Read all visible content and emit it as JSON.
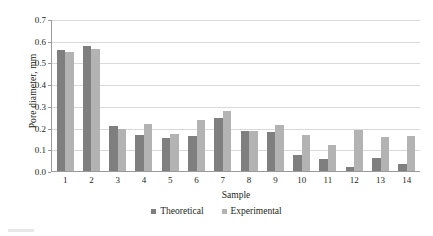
{
  "chart_data": {
    "type": "bar",
    "title": "",
    "xlabel": "Sample",
    "ylabel": "Pore diameter, mm",
    "categories": [
      "1",
      "2",
      "3",
      "4",
      "5",
      "6",
      "7",
      "8",
      "9",
      "10",
      "11",
      "12",
      "13",
      "14"
    ],
    "series": [
      {
        "name": "Theoretical",
        "color": "#7f7f7f",
        "values": [
          0.558,
          0.578,
          0.208,
          0.166,
          0.152,
          0.159,
          0.243,
          0.183,
          0.178,
          0.073,
          0.057,
          0.02,
          0.062,
          0.031
        ]
      },
      {
        "name": "Experimental",
        "color": "#b3b3b3",
        "values": [
          0.55,
          0.564,
          0.193,
          0.216,
          0.169,
          0.234,
          0.277,
          0.186,
          0.21,
          0.167,
          0.121,
          0.188,
          0.157,
          0.163
        ]
      }
    ],
    "ylim": [
      0.0,
      0.7
    ],
    "ytick_labels": [
      "0.7",
      "0.6",
      "0.5",
      "0.4",
      "0.3",
      "0.2",
      "0.1",
      "0.0"
    ],
    "ytick_values": [
      0.7,
      0.6,
      0.5,
      0.4,
      0.3,
      0.2,
      0.1,
      0.0
    ],
    "grid": true,
    "legend_position": "bottom"
  },
  "legend": {
    "entries": [
      {
        "label": "Theoretical",
        "color": "#7f7f7f"
      },
      {
        "label": "Experimental",
        "color": "#b3b3b3"
      }
    ]
  },
  "colors": {
    "theoretical": "#7f7f7f",
    "experimental": "#b3b3b3",
    "gridline": "#d9d9d9",
    "axis": "#9a9a9a",
    "text": "#231f20",
    "background": "#ffffff"
  }
}
